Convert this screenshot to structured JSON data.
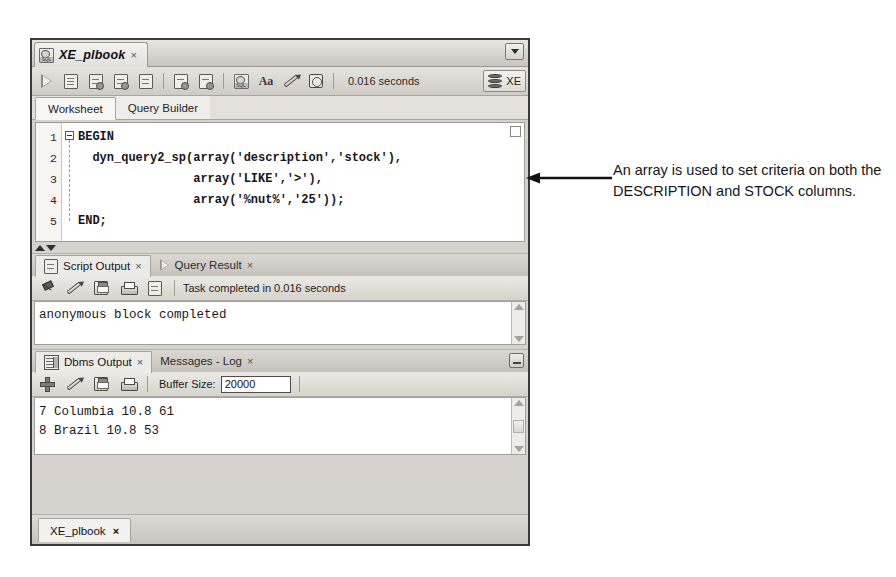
{
  "window": {
    "worksheet_tab": {
      "title": "XE_plbook",
      "close": "×",
      "icon": "sql-document-icon"
    },
    "strip_dropdown_icon": "chevron-down-icon"
  },
  "main_toolbar": {
    "buttons": [
      {
        "name": "run-statement-button",
        "icon": "run-triangle-icon"
      },
      {
        "name": "run-script-button",
        "icon": "script-sheet-icon"
      },
      {
        "name": "explain-plan-button",
        "icon": "explain-plan-icon"
      },
      {
        "name": "autotrace-button",
        "icon": "autotrace-icon"
      },
      {
        "name": "sql-history-button",
        "icon": "magnifier-sheet-icon"
      },
      {
        "name": "commit-button",
        "icon": "commit-check-icon"
      },
      {
        "name": "rollback-button",
        "icon": "rollback-db-icon"
      },
      {
        "name": "unshared-sql-worksheet-button",
        "icon": "sql-database-icon"
      },
      {
        "name": "format-text-button",
        "icon": "aa-font-icon"
      },
      {
        "name": "clear-button",
        "icon": "pencil-eraser-icon"
      },
      {
        "name": "timing-button",
        "icon": "clock-icon"
      }
    ],
    "elapsed_time": "0.016 seconds",
    "connection": {
      "name": "XE",
      "icon": "database-cylinder-icon"
    }
  },
  "sub_tabs": [
    {
      "label": "Worksheet",
      "active": true
    },
    {
      "label": "Query Builder",
      "active": false
    }
  ],
  "editor": {
    "line_numbers": [
      "1",
      "2",
      "3",
      "4",
      "5"
    ],
    "lines": [
      "BEGIN",
      "  dyn_query2_sp(array('description','stock'),",
      "                array('LIKE','>'),",
      "                array('%nut%','25'));",
      "END;"
    ],
    "fold_icon": "collapse-minus-icon",
    "marker_icon": "edit-marker-icon"
  },
  "splitter": {
    "up_icon": "triangle-up-icon",
    "down_icon": "triangle-down-icon"
  },
  "script_output_panel": {
    "tabs": [
      {
        "label": "Script Output",
        "close": "×",
        "active": true,
        "icon": "script-output-icon"
      },
      {
        "label": "Query Result",
        "close": "×",
        "active": false,
        "icon": "run-triangle-icon"
      }
    ],
    "toolbar": [
      {
        "name": "pin-button",
        "icon": "pin-icon"
      },
      {
        "name": "clear-button",
        "icon": "pencil-eraser-icon"
      },
      {
        "name": "save-button",
        "icon": "floppy-disk-icon"
      },
      {
        "name": "print-button",
        "icon": "printer-icon"
      },
      {
        "name": "open-in-editor-button",
        "icon": "script-sheet-icon"
      }
    ],
    "status": "Task completed in 0.016 seconds",
    "output_lines": [
      "anonymous block completed"
    ],
    "scrollbar": {
      "up_icon": "scroll-up-arrow-icon",
      "down_icon": "scroll-down-arrow-icon"
    }
  },
  "dbms_output_panel": {
    "tabs": [
      {
        "label": "Dbms Output",
        "close": "×",
        "active": true,
        "icon": "dbms-output-icon"
      },
      {
        "label": "Messages - Log",
        "close": "×",
        "active": false,
        "icon": ""
      }
    ],
    "restore_icon": "restore-window-icon",
    "toolbar": [
      {
        "name": "enable-dbms-output-button",
        "icon": "plus-icon"
      },
      {
        "name": "clear-button",
        "icon": "pencil-eraser-icon"
      },
      {
        "name": "save-button",
        "icon": "floppy-disk-icon"
      },
      {
        "name": "print-button",
        "icon": "printer-icon"
      }
    ],
    "buffer_label": "Buffer Size:",
    "buffer_value": "20000",
    "output_lines": [
      "7 Columbia 10.8 61",
      "8 Brazil 10.8 53"
    ],
    "scrollbar": {
      "up_icon": "scroll-up-arrow-icon",
      "down_icon": "scroll-down-arrow-icon"
    }
  },
  "bottom_tab": {
    "label": "XE_plbook",
    "close": "×"
  },
  "annotation": {
    "text": "An array is used to set criteria on both the DESCRIPTION and STOCK columns.",
    "arrow_icon": "callout-arrow-left-icon"
  }
}
